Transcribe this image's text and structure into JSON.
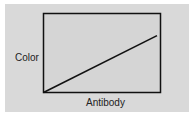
{
  "chart_data": {
    "type": "line",
    "title": "",
    "xlabel": "Antibody",
    "ylabel": "Color",
    "x": [
      0,
      1
    ],
    "series": [
      {
        "name": "Color vs Antibody",
        "values": [
          0,
          0.72
        ]
      }
    ],
    "xlim": [
      0,
      1
    ],
    "ylim": [
      0,
      1
    ],
    "grid": false,
    "ticks": false,
    "legend": null
  },
  "colors": {
    "panel_bg": "#d9d9d9",
    "plot_bg": "#d5d5d5",
    "axis": "#111111",
    "line": "#111111"
  }
}
